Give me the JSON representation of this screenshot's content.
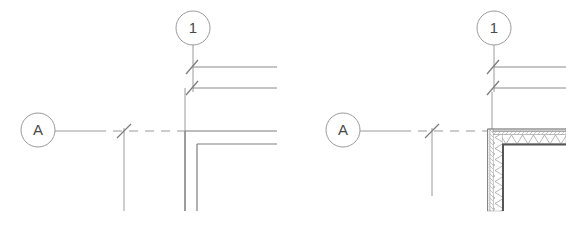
{
  "drawing": {
    "title": "Wall corner plan detail comparison",
    "background_color": "#ffffff",
    "line_color": "#8a8a8a",
    "line_color_dark": "#6e6e6e",
    "hatch_color": "#9a9a9a",
    "text_color": "#4a4a4a",
    "figures": [
      {
        "id": "left-figure",
        "name": "simple-wall-corner-detail",
        "grid_bubbles": [
          {
            "label": "1",
            "orientation": "vertical",
            "cx": 193,
            "cy": 28,
            "r": 17
          },
          {
            "label": "A",
            "orientation": "horizontal",
            "cx": 38,
            "cy": 130,
            "r": 17
          }
        ],
        "dimension_ticks": 4,
        "wall_type": "single-line-wall",
        "corner_x": 185,
        "corner_y": 131
      },
      {
        "id": "right-figure",
        "name": "hatched-composite-wall-corner-detail",
        "grid_bubbles": [
          {
            "label": "1",
            "orientation": "vertical",
            "cx": 494,
            "cy": 28,
            "r": 17
          },
          {
            "label": "A",
            "orientation": "horizontal",
            "cx": 343,
            "cy": 130,
            "r": 17
          }
        ],
        "dimension_ticks": 4,
        "wall_type": "hatched-composite-wall",
        "corner_x": 492,
        "corner_y": 131
      }
    ],
    "labels": {
      "bubble_one": "1",
      "bubble_a": "A"
    }
  }
}
